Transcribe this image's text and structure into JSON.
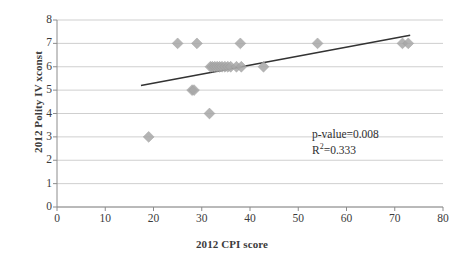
{
  "chart_data": {
    "type": "scatter",
    "title": "",
    "xlabel": "2012 CPI score",
    "ylabel": "2012 Polity IV xconst",
    "xlim": [
      0,
      80
    ],
    "ylim": [
      0,
      8
    ],
    "x_ticks": [
      0,
      10,
      20,
      30,
      40,
      50,
      60,
      70,
      80
    ],
    "y_ticks": [
      0,
      1,
      2,
      3,
      4,
      5,
      6,
      7,
      8
    ],
    "grid": "horizontal",
    "legend": "none",
    "marker": "diamond",
    "marker_color": "#a8a8a8",
    "points": [
      {
        "x": 19,
        "y": 3
      },
      {
        "x": 25,
        "y": 7
      },
      {
        "x": 28,
        "y": 5
      },
      {
        "x": 28.4,
        "y": 5
      },
      {
        "x": 29,
        "y": 7
      },
      {
        "x": 31.6,
        "y": 4
      },
      {
        "x": 31.8,
        "y": 6
      },
      {
        "x": 32.2,
        "y": 6
      },
      {
        "x": 32.7,
        "y": 6
      },
      {
        "x": 33.2,
        "y": 6
      },
      {
        "x": 33.7,
        "y": 6
      },
      {
        "x": 34.2,
        "y": 6
      },
      {
        "x": 34.8,
        "y": 6
      },
      {
        "x": 35.4,
        "y": 6
      },
      {
        "x": 36,
        "y": 6
      },
      {
        "x": 37.2,
        "y": 6
      },
      {
        "x": 38,
        "y": 7
      },
      {
        "x": 38.2,
        "y": 6
      },
      {
        "x": 42.8,
        "y": 6
      },
      {
        "x": 54,
        "y": 7
      },
      {
        "x": 71.6,
        "y": 7
      },
      {
        "x": 72.8,
        "y": 7
      }
    ],
    "trendline": {
      "type": "linear",
      "color": "#333333",
      "x_start": 17.4,
      "y_start": 5.2,
      "x_end": 73.2,
      "y_end": 7.35
    },
    "annotations": {
      "p_value": "p-value=0.008",
      "r_squared_prefix": "R",
      "r_squared_sup": "2",
      "r_squared_value": "=0.333"
    }
  },
  "colors": {
    "gridline": "#cfcfcf",
    "axis": "#8c8c8c",
    "text": "#3b3b3b",
    "marker": "#a8a8a8",
    "trendline": "#333333",
    "background": "#ffffff"
  }
}
